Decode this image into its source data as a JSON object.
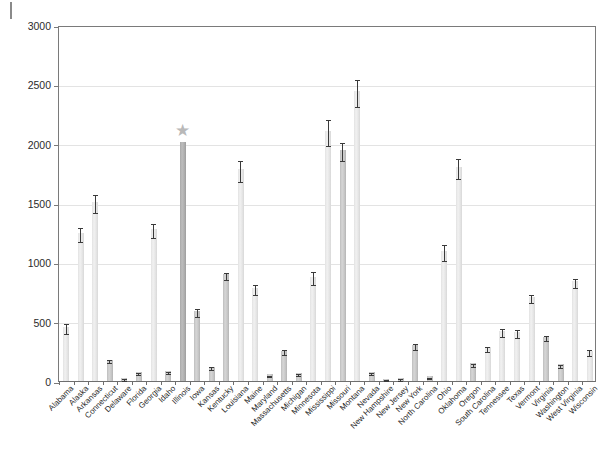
{
  "figure": {
    "star_glyph": "★",
    "star_state": "Illinois",
    "caption": ""
  },
  "chart_data": {
    "type": "bar",
    "title": "",
    "xlabel": "",
    "ylabel": "Average river otter harvest",
    "ylim": [
      0,
      3000
    ],
    "yticks": [
      0,
      500,
      1000,
      1500,
      2000,
      2500,
      3000
    ],
    "ytick_labels": [
      "0",
      "500",
      "1000",
      "1500",
      "2000",
      "2500",
      "3000"
    ],
    "grid": "horizontal",
    "legend": "none",
    "error_bars": "standard error",
    "annotations": [
      {
        "label": "★",
        "state": "Illinois",
        "meaning": "highlighted state"
      }
    ],
    "categories": [
      "Alabama",
      "Alaska",
      "Arkansas",
      "Connecticut",
      "Delaware",
      "Florida",
      "Georgia",
      "Idaho",
      "Illinois",
      "Iowa",
      "Kansas",
      "Kentucky",
      "Louisiana",
      "Maine",
      "Maryland",
      "Massachusetts",
      "Michigan",
      "Minnesota",
      "Mississippi",
      "Missouri",
      "Montana",
      "Nevada",
      "New Hampshire",
      "New Jersey",
      "New York",
      "North Carolina",
      "Ohio",
      "Oklahoma",
      "Oregon",
      "South Carolina",
      "Tennessee",
      "Texas",
      "Vermont",
      "Virginia",
      "Washington",
      "West Virginia",
      "Wisconsin"
    ],
    "values": [
      455,
      1245,
      1510,
      180,
      25,
      75,
      1280,
      85,
      2010,
      590,
      120,
      900,
      1785,
      785,
      55,
      255,
      70,
      880,
      2105,
      1945,
      2440,
      75,
      20,
      25,
      300,
      40,
      1095,
      1800,
      150,
      285,
      420,
      415,
      705,
      375,
      140,
      840,
      255
    ],
    "errors": [
      45,
      60,
      75,
      12,
      5,
      10,
      60,
      8,
      0,
      35,
      12,
      30,
      90,
      40,
      6,
      20,
      8,
      55,
      110,
      75,
      115,
      8,
      4,
      5,
      25,
      6,
      70,
      85,
      14,
      22,
      35,
      32,
      35,
      22,
      14,
      38,
      25
    ],
    "shades": [
      "light",
      "light",
      "light",
      "mid",
      "mid",
      "mid",
      "light",
      "mid",
      "dark",
      "mid",
      "mid",
      "mid",
      "light",
      "light",
      "mid",
      "mid",
      "mid",
      "light",
      "light",
      "mid",
      "light",
      "mid",
      "mid",
      "mid",
      "mid",
      "mid",
      "light",
      "light",
      "mid",
      "light",
      "light",
      "light",
      "light",
      "mid",
      "mid",
      "light",
      "light"
    ]
  }
}
